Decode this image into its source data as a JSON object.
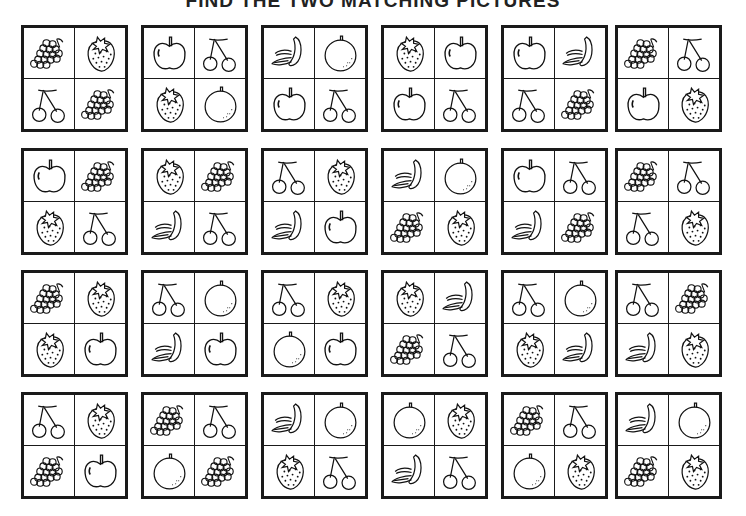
{
  "title": "FIND THE TWO MATCHING PICTURES",
  "layout": {
    "cols": 6,
    "rows": 4,
    "x": [
      21,
      141,
      261,
      381,
      501,
      615
    ],
    "y": [
      25,
      148,
      270,
      392
    ]
  },
  "fruit_types": [
    "grapes",
    "strawberry",
    "cherries",
    "apple",
    "orange",
    "banana"
  ],
  "puzzles": [
    [
      "grapes",
      "strawberry",
      "cherries",
      "grapes"
    ],
    [
      "apple",
      "cherries",
      "strawberry",
      "orange"
    ],
    [
      "banana",
      "orange",
      "apple",
      "cherries"
    ],
    [
      "strawberry",
      "apple",
      "apple",
      "cherries"
    ],
    [
      "apple",
      "banana",
      "cherries",
      "grapes"
    ],
    [
      "grapes",
      "cherries",
      "apple",
      "strawberry"
    ],
    [
      "apple",
      "grapes",
      "strawberry",
      "cherries"
    ],
    [
      "strawberry",
      "grapes",
      "banana",
      "cherries"
    ],
    [
      "cherries",
      "strawberry",
      "banana",
      "apple"
    ],
    [
      "banana",
      "orange",
      "grapes",
      "strawberry"
    ],
    [
      "apple",
      "cherries",
      "banana",
      "grapes"
    ],
    [
      "grapes",
      "cherries",
      "cherries",
      "strawberry"
    ],
    [
      "grapes",
      "strawberry",
      "strawberry",
      "apple"
    ],
    [
      "cherries",
      "orange",
      "banana",
      "apple"
    ],
    [
      "cherries",
      "strawberry",
      "orange",
      "apple"
    ],
    [
      "strawberry",
      "banana",
      "grapes",
      "cherries"
    ],
    [
      "cherries",
      "orange",
      "strawberry",
      "banana"
    ],
    [
      "cherries",
      "grapes",
      "banana",
      "strawberry"
    ],
    [
      "cherries",
      "strawberry",
      "grapes",
      "apple"
    ],
    [
      "grapes",
      "cherries",
      "orange",
      "grapes"
    ],
    [
      "banana",
      "orange",
      "strawberry",
      "cherries"
    ],
    [
      "orange",
      "strawberry",
      "banana",
      "cherries"
    ],
    [
      "grapes",
      "cherries",
      "orange",
      "strawberry"
    ],
    [
      "banana",
      "orange",
      "grapes",
      "strawberry"
    ]
  ]
}
